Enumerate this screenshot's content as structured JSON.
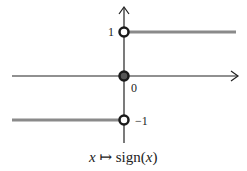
{
  "chart_data": {
    "type": "line",
    "title": "x ↦ sign(x)",
    "caption": {
      "var": "x",
      "mapsto": "↦",
      "func": "sign(",
      "arg": "x",
      "close": ")"
    },
    "xlabel": "",
    "ylabel": "",
    "xlim": [
      -1,
      1
    ],
    "ylim": [
      -1.3,
      1.3
    ],
    "y_tick_labels": [
      "1",
      "0",
      "−1"
    ],
    "y_tick_values": [
      1,
      0,
      -1
    ],
    "series": [
      {
        "name": "negative branch",
        "x": [
          -1,
          0
        ],
        "y": [
          -1,
          -1
        ]
      },
      {
        "name": "positive branch",
        "x": [
          0,
          1
        ],
        "y": [
          1,
          1
        ]
      }
    ],
    "points": [
      {
        "name": "open-circle-top",
        "x": 0,
        "y": 1,
        "filled": false
      },
      {
        "name": "filled-point-origin",
        "x": 0,
        "y": 0,
        "filled": true
      },
      {
        "name": "open-circle-bottom",
        "x": 0,
        "y": -1,
        "filled": false
      }
    ],
    "grid": false,
    "legend": "none"
  },
  "colors": {
    "axis": "#222222",
    "branch": "#8a8a8a",
    "filled_point": "#555555"
  }
}
